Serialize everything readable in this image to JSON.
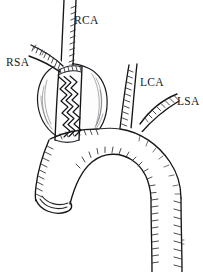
{
  "figure": {
    "background_color": "#ffffff",
    "ink_color": "#16161a",
    "width": 203,
    "height": 272,
    "style": "pen-and-ink line drawing with hatching"
  },
  "labels": [
    {
      "id": "rca",
      "text": "RCA",
      "meaning": "right carotid artery",
      "x": 74,
      "y": 24
    },
    {
      "id": "rsa",
      "text": "RSA",
      "meaning": "right subclavian artery",
      "x": 6,
      "y": 66
    },
    {
      "id": "lca",
      "text": "LCA",
      "meaning": "left carotid artery",
      "x": 140,
      "y": 86
    },
    {
      "id": "lsa",
      "text": "LSA",
      "meaning": "left subclavian artery",
      "x": 177,
      "y": 105
    }
  ],
  "structures": [
    {
      "id": "aneurysm-sac",
      "name": "aneurysm sac"
    },
    {
      "id": "stent-graft",
      "name": "zigzag stent graft"
    },
    {
      "id": "ascending-aorta",
      "name": "ascending aorta stump"
    },
    {
      "id": "aortic-arch",
      "name": "aortic arch"
    },
    {
      "id": "descending-aorta",
      "name": "descending aorta"
    }
  ]
}
